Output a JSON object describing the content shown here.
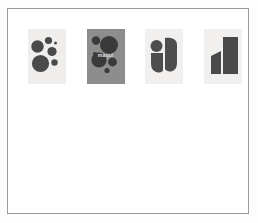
{
  "page": {
    "background_color": "#fdfdfd",
    "sheet_background_color": "#ffffff",
    "border_color": "#9a9a9a"
  },
  "gallery": {
    "name": "image-row",
    "items": [
      {
        "id": "panel-circles-light",
        "caption": "",
        "background_color": "#efeeec",
        "shape_color": "#4a4a4a",
        "shape_kind": "circles"
      },
      {
        "id": "panel-circles-gray",
        "caption": "maqul",
        "background_color": "#8d8d8d",
        "shape_color": "#3a3a3a",
        "shape_kind": "circles-labeled",
        "label_color": "#f2f2f2"
      },
      {
        "id": "panel-clover",
        "caption": "",
        "background_color": "#f1f0ee",
        "shape_color": "#4d4d4d",
        "shape_kind": "four-petal"
      },
      {
        "id": "panel-angular",
        "caption": "",
        "background_color": "#f1f0ee",
        "shape_color": "#4a4a4a",
        "shape_kind": "parallelograms"
      }
    ]
  }
}
